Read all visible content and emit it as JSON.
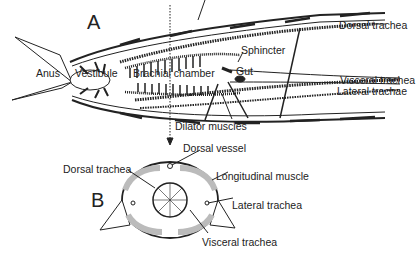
{
  "figure": {
    "panels": [
      {
        "id": "A",
        "label": "A",
        "description": "Longitudinal section of abdomen"
      },
      {
        "id": "B",
        "label": "B",
        "description": "Cross section through branchial chamber"
      }
    ],
    "panel_a_labels": {
      "anus": "Anus",
      "vestibule": "Vestibule",
      "branchial_chamber": "Brachial chamber",
      "sphincter": "Sphincter",
      "gut": "Gut",
      "dorsal_trachea": "Dorsal trachea",
      "visceral_trachea": "Visceral trachea",
      "lateral_trachae": "Lateral trachae",
      "dilator_muscles": "Dilator muscles"
    },
    "panel_b_labels": {
      "dorsal_vessel": "Dorsal vessel",
      "dorsal_trachea": "Dorsal trachea",
      "longitudinal_muscle": "Longitudinal muscle",
      "lateral_trachea": "Lateral trachea",
      "visceral_trachea": "Visceral trachea"
    },
    "colors": {
      "ink": "#222222",
      "fill_light": "#e8e8e8",
      "fill_dark": "#333333",
      "background": "#ffffff"
    }
  }
}
